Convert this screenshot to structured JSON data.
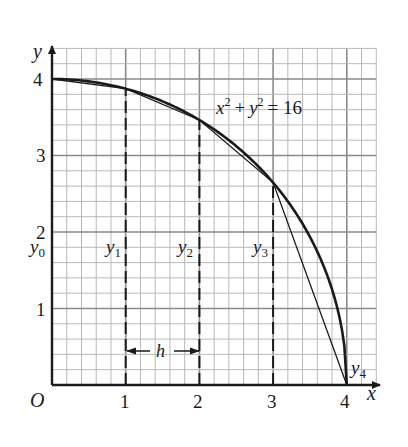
{
  "figure": {
    "equation": {
      "base": "x",
      "plus": "+",
      "base2": "y",
      "exp": "2",
      "rhs": "= 16"
    },
    "axes": {
      "x_label": "x",
      "y_label": "y",
      "origin_label": "O",
      "x_ticks": [
        "1",
        "2",
        "3",
        "4"
      ],
      "y_ticks": [
        "1",
        "2",
        "3",
        "4"
      ]
    },
    "ordinate_labels": [
      {
        "sym": "y",
        "sub": "0"
      },
      {
        "sym": "y",
        "sub": "1"
      },
      {
        "sym": "y",
        "sub": "2"
      },
      {
        "sym": "y",
        "sub": "3"
      },
      {
        "sym": "y",
        "sub": "4"
      }
    ],
    "step_label": "h",
    "colors": {
      "ink": "#1a1a1a",
      "grid": "#b8b8b8",
      "grid_major": "#8a8a8a",
      "background": "#ffffff"
    }
  },
  "chart_data": {
    "type": "line",
    "title": "",
    "equation": "x^2 + y^2 = 16",
    "xlabel": "x",
    "ylabel": "y",
    "xlim": [
      0,
      4.4
    ],
    "ylim": [
      0,
      4.4
    ],
    "grid": true,
    "grid_minor_step": 0.2,
    "x_ticks": [
      1,
      2,
      3,
      4
    ],
    "y_ticks": [
      1,
      2,
      3,
      4
    ],
    "series": [
      {
        "name": "curve y = sqrt(16 - x^2)",
        "x": [
          0,
          0.5,
          1,
          1.5,
          2,
          2.5,
          3,
          3.25,
          3.5,
          3.75,
          3.9,
          4
        ],
        "y": [
          4,
          3.969,
          3.873,
          3.708,
          3.464,
          3.122,
          2.646,
          2.333,
          1.936,
          1.392,
          0.889,
          0
        ]
      },
      {
        "name": "trapezoid chords",
        "x": [
          0,
          1,
          2,
          3,
          4
        ],
        "y": [
          4,
          3.873,
          3.464,
          2.646,
          0
        ]
      }
    ],
    "ordinates": [
      {
        "label": "y0",
        "x": 0,
        "y": 4
      },
      {
        "label": "y1",
        "x": 1,
        "y": 3.873
      },
      {
        "label": "y2",
        "x": 2,
        "y": 3.464
      },
      {
        "label": "y3",
        "x": 3,
        "y": 2.646
      },
      {
        "label": "y4",
        "x": 4,
        "y": 0
      }
    ],
    "annotations": [
      "h (interval width between x=1 and x=2)",
      "x^2 + y^2 = 16"
    ]
  }
}
